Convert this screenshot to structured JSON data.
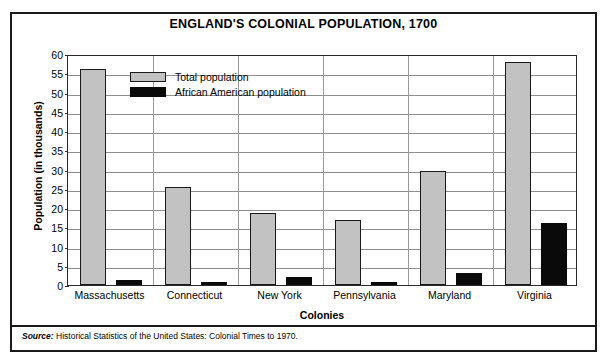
{
  "chart_data": {
    "type": "bar",
    "title": "ENGLAND'S COLONIAL POPULATION, 1700",
    "xlabel": "Colonies",
    "ylabel": "Population (in thousands)",
    "ylim": [
      0,
      60
    ],
    "ytick_step": 5,
    "yticks": [
      0,
      5,
      10,
      15,
      20,
      25,
      30,
      35,
      40,
      45,
      50,
      55,
      60
    ],
    "grid": "horizontal",
    "legend_position": "inside-top-left",
    "categories": [
      "Massachusetts",
      "Connecticut",
      "New York",
      "Pennsylvania",
      "Maryland",
      "Virginia"
    ],
    "series": [
      {
        "name": "Total population",
        "color": "#c2c2c2",
        "values": [
          56.0,
          25.4,
          18.7,
          17.0,
          29.6,
          58.0
        ]
      },
      {
        "name": "African American population",
        "color": "#0a0a0a",
        "values": [
          1.2,
          0.7,
          2.1,
          0.6,
          3.2,
          16.0
        ]
      }
    ]
  },
  "footer": {
    "source_label": "Source:",
    "source_text": "Historical Statistics of the United States: Colonial Times to 1970."
  }
}
